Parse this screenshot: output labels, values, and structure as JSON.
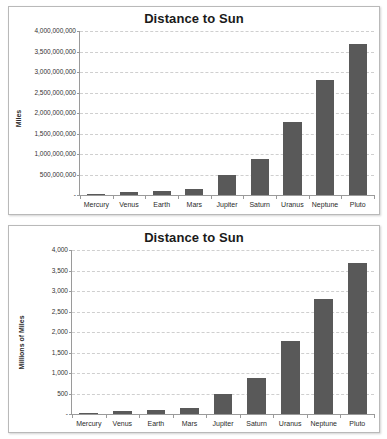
{
  "chart_data": [
    {
      "id": "top",
      "type": "bar",
      "title": "Distance to Sun",
      "xlabel": "",
      "ylabel": "Miles",
      "categories": [
        "Mercury",
        "Venus",
        "Earth",
        "Mars",
        "Jupiter",
        "Saturn",
        "Uranus",
        "Neptune",
        "Pluto"
      ],
      "values": [
        36000000,
        67000000,
        93000000,
        142000000,
        484000000,
        888000000,
        1784000000,
        2794000000,
        3674000000
      ],
      "ylim": [
        0,
        4000000000
      ],
      "yticks": [
        0,
        500000000,
        1000000000,
        1500000000,
        2000000000,
        2500000000,
        3000000000,
        3500000000,
        4000000000
      ],
      "ytick_labels": [
        "-",
        "500,000,000",
        "1,000,000,000",
        "1,500,000,000",
        "2,000,000,000",
        "2,500,000,000",
        "3,000,000,000",
        "3,500,000,000",
        "4,000,000,000"
      ],
      "grid": true,
      "legend": "none",
      "bar_color": "#595959",
      "grid_color": "#cfcfcf",
      "axis_color": "#9a9a9a"
    },
    {
      "id": "bottom",
      "type": "bar",
      "title": "Distance to Sun",
      "xlabel": "",
      "ylabel": "Millions of Miles",
      "categories": [
        "Mercury",
        "Venus",
        "Earth",
        "Mars",
        "Jupiter",
        "Saturn",
        "Uranus",
        "Neptune",
        "Pluto"
      ],
      "values": [
        36,
        67,
        93,
        142,
        484,
        888,
        1784,
        2794,
        3674
      ],
      "ylim": [
        0,
        4000
      ],
      "yticks": [
        0,
        500,
        1000,
        1500,
        2000,
        2500,
        3000,
        3500,
        4000
      ],
      "ytick_labels": [
        "-",
        "500",
        "1,000",
        "1,500",
        "2,000",
        "2,500",
        "3,000",
        "3,500",
        "4,000"
      ],
      "grid": true,
      "legend": "none",
      "bar_color": "#595959",
      "grid_color": "#cfcfcf",
      "axis_color": "#9a9a9a"
    }
  ]
}
